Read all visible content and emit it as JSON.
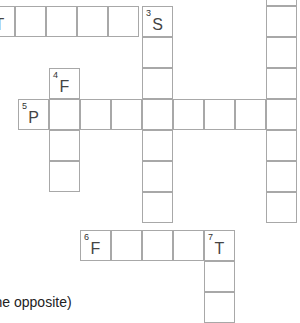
{
  "puzzle": {
    "cell_size": 31,
    "border_color": "#a8a8a8",
    "cells": [
      {
        "x": -16,
        "y": 6,
        "letter": "T",
        "num": ""
      },
      {
        "x": 15,
        "y": 6,
        "letter": "",
        "num": ""
      },
      {
        "x": 46,
        "y": 6,
        "letter": "",
        "num": ""
      },
      {
        "x": 77,
        "y": 6,
        "letter": "",
        "num": ""
      },
      {
        "x": 108,
        "y": 6,
        "letter": "",
        "num": ""
      },
      {
        "x": 142,
        "y": 6,
        "letter": "S",
        "num": "3"
      },
      {
        "x": 142,
        "y": 37,
        "letter": "",
        "num": ""
      },
      {
        "x": 142,
        "y": 68,
        "letter": "",
        "num": ""
      },
      {
        "x": 142,
        "y": 130,
        "letter": "",
        "num": ""
      },
      {
        "x": 142,
        "y": 161,
        "letter": "",
        "num": ""
      },
      {
        "x": 142,
        "y": 192,
        "letter": "",
        "num": ""
      },
      {
        "x": 49,
        "y": 68,
        "letter": "F",
        "num": "4"
      },
      {
        "x": 49,
        "y": 130,
        "letter": "",
        "num": ""
      },
      {
        "x": 49,
        "y": 161,
        "letter": "",
        "num": ""
      },
      {
        "x": 18,
        "y": 99,
        "letter": "P",
        "num": "5"
      },
      {
        "x": 49,
        "y": 99,
        "letter": "",
        "num": ""
      },
      {
        "x": 80,
        "y": 99,
        "letter": "",
        "num": ""
      },
      {
        "x": 111,
        "y": 99,
        "letter": "",
        "num": ""
      },
      {
        "x": 142,
        "y": 99,
        "letter": "",
        "num": ""
      },
      {
        "x": 173,
        "y": 99,
        "letter": "",
        "num": ""
      },
      {
        "x": 204,
        "y": 99,
        "letter": "",
        "num": ""
      },
      {
        "x": 235,
        "y": 99,
        "letter": "",
        "num": ""
      },
      {
        "x": 266,
        "y": 99,
        "letter": "",
        "num": ""
      },
      {
        "x": 266,
        "y": -25,
        "letter": "",
        "num": ""
      },
      {
        "x": 266,
        "y": 6,
        "letter": "",
        "num": ""
      },
      {
        "x": 266,
        "y": 37,
        "letter": "",
        "num": ""
      },
      {
        "x": 266,
        "y": 68,
        "letter": "",
        "num": ""
      },
      {
        "x": 266,
        "y": 130,
        "letter": "",
        "num": ""
      },
      {
        "x": 266,
        "y": 161,
        "letter": "",
        "num": ""
      },
      {
        "x": 266,
        "y": 192,
        "letter": "",
        "num": ""
      },
      {
        "x": 80,
        "y": 230,
        "letter": "F",
        "num": "6"
      },
      {
        "x": 111,
        "y": 230,
        "letter": "",
        "num": ""
      },
      {
        "x": 142,
        "y": 230,
        "letter": "",
        "num": ""
      },
      {
        "x": 173,
        "y": 230,
        "letter": "",
        "num": ""
      },
      {
        "x": 204,
        "y": 230,
        "letter": "T",
        "num": "7"
      },
      {
        "x": 204,
        "y": 261,
        "letter": "",
        "num": ""
      },
      {
        "x": 204,
        "y": 292,
        "letter": "",
        "num": ""
      }
    ]
  },
  "clue_fragment": "(the opposite)"
}
